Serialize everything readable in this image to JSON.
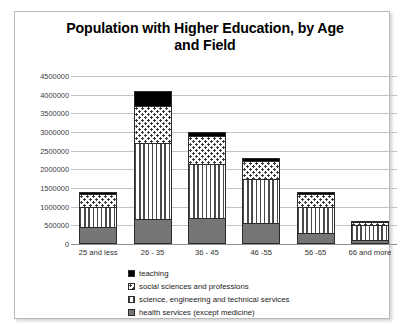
{
  "chart_data": {
    "type": "bar",
    "stacked": true,
    "title": "Population with Higher Education, by Age and Field",
    "xlabel": "",
    "ylabel": "",
    "ylim": [
      0,
      4500000
    ],
    "ytick_labels": [
      "4500000",
      "4000000",
      "3500000",
      "3000000",
      "2500000",
      "2000000",
      "1500000",
      "1000000",
      "500000",
      "0"
    ],
    "ytick_values": [
      4500000,
      4000000,
      3500000,
      3000000,
      2500000,
      2000000,
      1500000,
      1000000,
      500000,
      0
    ],
    "grid": true,
    "legend_position": "bottom-left",
    "categories": [
      "25 and less",
      "26 - 35",
      "36 - 45",
      "46 -55",
      "56 -65",
      "66 and more"
    ],
    "series": [
      {
        "name": "health services (except medicine)",
        "pattern": "solid-grey",
        "color": "#757575",
        "values": [
          450000,
          670000,
          700000,
          550000,
          300000,
          120000
        ]
      },
      {
        "name": "science, engineering and technical services",
        "pattern": "vertical-stripes",
        "color": "#4a4a4a",
        "values": [
          550000,
          2030000,
          1450000,
          1200000,
          700000,
          400000
        ]
      },
      {
        "name": "social sciences and professions",
        "pattern": "dots",
        "color": "#3b3b3b",
        "values": [
          330000,
          1000000,
          750000,
          480000,
          350000,
          60000
        ]
      },
      {
        "name": "teaching",
        "pattern": "solid-black",
        "color": "#000000",
        "values": [
          70000,
          400000,
          100000,
          70000,
          50000,
          40000
        ]
      }
    ],
    "totals": [
      1400000,
      4100000,
      3000000,
      2300000,
      1400000,
      620000
    ]
  },
  "legend": {
    "items": [
      {
        "label": "teaching",
        "pattern": "solid-black"
      },
      {
        "label": "social sciences and professions",
        "pattern": "dots"
      },
      {
        "label": "science, engineering and technical services",
        "pattern": "vertical-stripes"
      },
      {
        "label": "health services (except medicine)",
        "pattern": "solid-grey"
      }
    ]
  }
}
